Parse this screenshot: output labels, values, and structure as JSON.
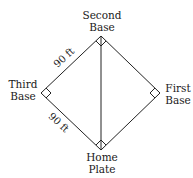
{
  "diagram": {
    "vertices": {
      "second_base": {
        "label_line1": "Second",
        "label_line2": "Base",
        "x": 101,
        "y": 36
      },
      "third_base": {
        "label_line1": "Third",
        "label_line2": "Base",
        "x": 41,
        "y": 93
      },
      "first_base": {
        "label_line1": "First",
        "label_line2": "Base",
        "x": 160,
        "y": 93
      },
      "home_plate": {
        "label_line1": "Home",
        "label_line2": "Plate",
        "x": 101,
        "y": 150
      }
    },
    "edges": [
      {
        "from": "second_base",
        "to": "third_base",
        "label": "90 ft"
      },
      {
        "from": "third_base",
        "to": "home_plate",
        "label": "90 ft"
      },
      {
        "from": "home_plate",
        "to": "first_base",
        "label": ""
      },
      {
        "from": "first_base",
        "to": "second_base",
        "label": ""
      }
    ],
    "diagonal": {
      "from": "second_base",
      "to": "home_plate",
      "label": ""
    },
    "right_angle_markers": [
      "second_base",
      "third_base",
      "first_base",
      "home_plate"
    ],
    "line_color": "#222222",
    "text_color": "#1a1a1a"
  }
}
